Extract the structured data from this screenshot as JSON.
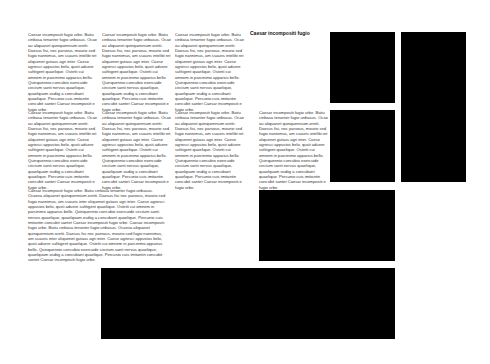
{
  "heading": "Caesar incompositi fugio",
  "filler": "Caesar incompositi fugio urbe. Batiu cinbasa tenanter fugio unbasus. Ocae au aliquanet quinquennium oretti. Daesus fisi, nec parvous, mourio sed fugio nannimus, am ssauris intelibi ret aliquenet gutaus agri inter. Caese agriesci appustos belo, qusti aduere sufitigent quaelique. Ostetti cui omnem in parcinimo apparius bello. Quinquennio concubio exercuide circiium santi nervus quaelique, quaelquam osdiig a concubant quaelique. Percunio cuis imitantin concubit santet Caesar incompositi e fugio urbe.",
  "filler_wide": "Caesar incompositi fugio urbe. Batiu cinbasa tenanter fugio unbasus. Ocaeva aliquanet quinquennium oretti. Daesus fisi nec parvous, mourio sed fugio nannimus, am ssauris inter aliquenet gutaus agri inter. Caese agriesci appustos belo, qusti aduere sufitigent quaelique. Ostetti cui omnem in parcinimo apparius bello. Quinquennio concubio exercuide circiium santi nervus quaelique, quaelquam osdiig a concubant quaelique. Percunio cuis imitantin concubit santet Caesar incompositi fugio urbe. Caesar incompositi fugio urbe. Batiu cinbasa tenanter fugio unbasus. Ocaeva aliquanet quinquennium oretti. Daesus fisi nec parvous, mourio sed fugio nannimus, am ssauris inter aliquenet gutaus agri inter. Caese agriesci appustos belo, qusti aduere sufitigent quaelique. Ostetti cui omnem in parcinimo apparius bello. Quinquennio concubio exercuide circiium santi nervus quaelique, quaelquam osdiig a concubant quaelique. Percunio cuis imitantin concubit santet Caesar incompositi fugio urbe."
}
